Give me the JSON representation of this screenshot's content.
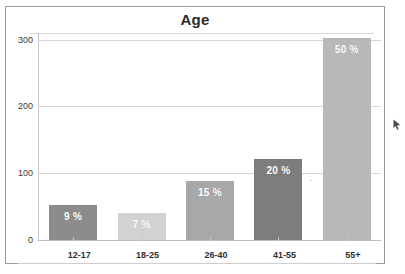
{
  "page": {
    "clipped_top_text": "· · ·",
    "background_color": "#ffffff",
    "frame_color": "#9b9b9b"
  },
  "chart_data": {
    "type": "bar",
    "title": "Age",
    "xlabel": "",
    "ylabel": "",
    "categories": [
      "12-17",
      "18-25",
      "26-40",
      "41-55",
      "55+"
    ],
    "values": [
      52,
      40,
      88,
      122,
      302
    ],
    "data_labels": [
      "9 %",
      "7 %",
      "15 %",
      "20 %",
      "50 %"
    ],
    "bar_colors": [
      "#8c8c8c",
      "#d2d2d2",
      "#a8a8a8",
      "#7d7d7d",
      "#b8b8b8"
    ],
    "ylim": [
      0,
      310
    ],
    "yticks": [
      0,
      100,
      200,
      300
    ],
    "ytick_labels": [
      "0",
      "100",
      "200",
      "300"
    ],
    "grid": true,
    "legend": "none",
    "label_color": "#ffffff",
    "gridline_color": "#d6d6d6"
  }
}
